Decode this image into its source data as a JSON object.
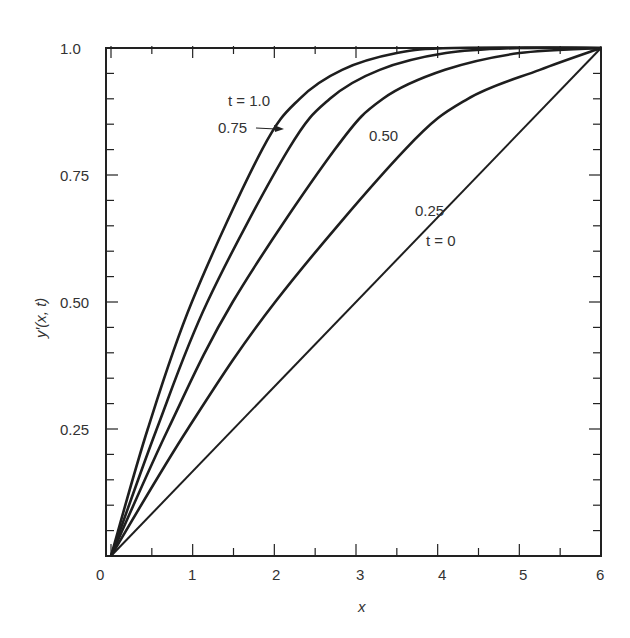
{
  "chart_data": {
    "type": "line",
    "title": "",
    "xlabel": "x",
    "ylabel": "y′(x, t)",
    "xlim": [
      0,
      6
    ],
    "ylim": [
      0,
      1.0
    ],
    "grid": false,
    "legend": "none (inline curve labels)",
    "x_ticks": [
      "0",
      "1",
      "2",
      "3",
      "4",
      "5",
      "6"
    ],
    "y_ticks": [
      "1.0",
      "0.75",
      "0.50",
      "0.25"
    ],
    "series": [
      {
        "name": "t = 1.0",
        "label": "t = 1.0",
        "points": [
          [
            0,
            0
          ],
          [
            0.45,
            0.25
          ],
          [
            0.99,
            0.5
          ],
          [
            1.85,
            0.8
          ],
          [
            2.31,
            0.9
          ],
          [
            2.83,
            0.957
          ],
          [
            3.5,
            0.99
          ],
          [
            4.2,
            1.0
          ],
          [
            6,
            1.0
          ]
        ]
      },
      {
        "name": "t = 0.75",
        "label": "0.75",
        "points": [
          [
            0,
            0
          ],
          [
            0.56,
            0.25
          ],
          [
            1.18,
            0.5
          ],
          [
            2.17,
            0.8
          ],
          [
            2.68,
            0.9
          ],
          [
            3.29,
            0.957
          ],
          [
            4.1,
            0.99
          ],
          [
            5.0,
            1.0
          ],
          [
            6,
            1.0
          ]
        ]
      },
      {
        "name": "t = 0.50",
        "label": "0.50",
        "points": [
          [
            0,
            0
          ],
          [
            0.7,
            0.25
          ],
          [
            1.49,
            0.5
          ],
          [
            2.74,
            0.8
          ],
          [
            3.33,
            0.9
          ],
          [
            4.09,
            0.957
          ],
          [
            5.0,
            0.99
          ],
          [
            6,
            1.0
          ]
        ]
      },
      {
        "name": "t = 0.25",
        "label": "0.25",
        "points": [
          [
            0,
            0
          ],
          [
            0.94,
            0.25
          ],
          [
            2.01,
            0.5
          ],
          [
            3.6,
            0.8
          ],
          [
            4.37,
            0.9
          ],
          [
            5.25,
            0.957
          ],
          [
            6,
            1.0
          ]
        ]
      },
      {
        "name": "t = 0",
        "label": "t = 0",
        "points": [
          [
            0,
            0
          ],
          [
            6,
            1.0
          ]
        ]
      }
    ],
    "annotations": [
      {
        "text": "t = 1.0",
        "near": [
          1.8,
          0.9
        ]
      },
      {
        "text": "0.75",
        "near": [
          1.5,
          0.83
        ],
        "arrow_to": [
          2.2,
          0.83
        ]
      },
      {
        "text": "0.50",
        "near": [
          3.1,
          0.8
        ]
      },
      {
        "text": "0.25",
        "near": [
          3.8,
          0.63
        ]
      },
      {
        "text": "t = 0",
        "near": [
          4.0,
          0.5
        ]
      }
    ]
  },
  "labels": {
    "x_axis": "x",
    "y_axis": "y′(x, t)",
    "x_ticks": [
      "0",
      "1",
      "2",
      "3",
      "4",
      "5",
      "6"
    ],
    "y_tick_1": "1.0",
    "y_tick_075": "0.75",
    "y_tick_050": "0.50",
    "y_tick_025": "0.25",
    "curve_t1": "t = 1.0",
    "curve_t075": "0.75",
    "curve_t050": "0.50",
    "curve_t025": "0.25",
    "curve_t0": "t = 0"
  }
}
